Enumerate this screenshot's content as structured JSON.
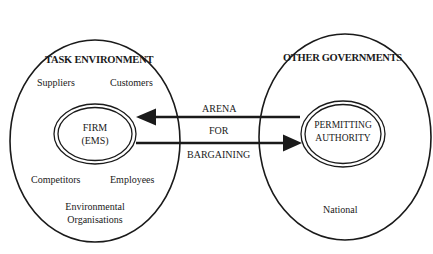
{
  "diagram": {
    "left_environment": {
      "title": "TASK ENVIRONMENT",
      "items": {
        "suppliers": "Suppliers",
        "customers": "Customers",
        "competitors": "Competitors",
        "employees": "Employees",
        "env_org_line1": "Environmental",
        "env_org_line2": "Organisations"
      },
      "core": {
        "line1": "FIRM",
        "line2": "(EMS)"
      }
    },
    "right_environment": {
      "title": "OTHER GOVERNMENTS",
      "items": {
        "national": "National"
      },
      "core": {
        "line1": "PERMITTING",
        "line2": "AUTHORITY"
      }
    },
    "connector": {
      "label_top": "ARENA",
      "label_middle": "FOR",
      "label_bottom": "BARGAINING",
      "arrows": [
        {
          "from": "permitting-authority",
          "to": "firm"
        },
        {
          "from": "firm",
          "to": "permitting-authority"
        }
      ]
    },
    "colors": {
      "stroke": "#1a1a1a",
      "background": "#ffffff"
    }
  }
}
